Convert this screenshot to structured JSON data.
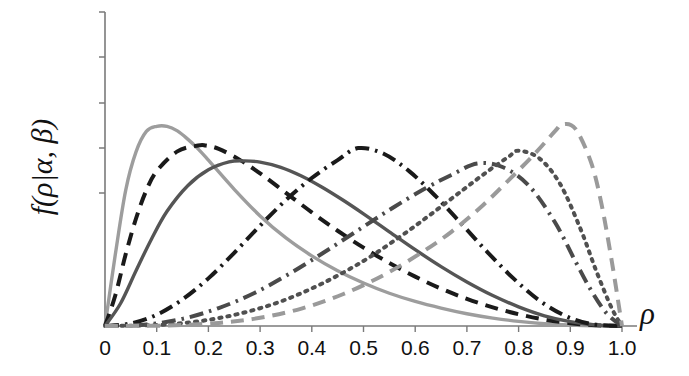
{
  "chart_data": {
    "type": "line",
    "title": "",
    "subtitle": "",
    "xlabel": "ρ",
    "ylabel": "f(ρ|α, β)",
    "xlim": [
      0,
      1.0
    ],
    "ylim": [
      0,
      1.0
    ],
    "grid": false,
    "legend": "none",
    "y_axis_ticks_labeled": false,
    "y_tick_count": 5,
    "x_tick_labels": [
      "0",
      "0.1",
      "0.2",
      "0.3",
      "0.4",
      "0.5",
      "0.6",
      "0.7",
      "0.8",
      "0.9",
      "1.0"
    ],
    "x_tick_values": [
      0,
      0.1,
      0.2,
      0.3,
      0.4,
      0.5,
      0.6,
      0.7,
      0.8,
      0.9,
      1.0
    ],
    "series": [
      {
        "name": "curve-1",
        "style": "solid",
        "color": "#9d9d9d",
        "alpha": 2.6,
        "beta": 12.7,
        "peak_x": 0.12,
        "peak_y": 0.78,
        "x": [
          0.0,
          0.02,
          0.04,
          0.06,
          0.08,
          0.1,
          0.12,
          0.14,
          0.16,
          0.18,
          0.2,
          0.25,
          0.3,
          0.35,
          0.4,
          0.45,
          0.5,
          0.55,
          0.6,
          0.65,
          0.7,
          0.75,
          0.8,
          0.85,
          0.9,
          0.95,
          1.0
        ],
        "y": [
          0.0,
          0.28,
          0.53,
          0.68,
          0.76,
          0.78,
          0.78,
          0.762,
          0.73,
          0.692,
          0.648,
          0.534,
          0.43,
          0.344,
          0.274,
          0.216,
          0.168,
          0.128,
          0.096,
          0.07,
          0.048,
          0.031,
          0.018,
          0.009,
          0.004,
          0.001,
          0.0
        ]
      },
      {
        "name": "curve-2",
        "style": "dashed",
        "color": "#1a1a1a",
        "alpha": 3.1,
        "beta": 10.5,
        "peak_x": 0.195,
        "peak_y": 0.705,
        "x": [
          0.0,
          0.02,
          0.04,
          0.06,
          0.08,
          0.1,
          0.14,
          0.18,
          0.195,
          0.22,
          0.26,
          0.3,
          0.35,
          0.4,
          0.45,
          0.5,
          0.55,
          0.6,
          0.65,
          0.7,
          0.75,
          0.8,
          0.85,
          0.9,
          0.95,
          1.0
        ],
        "y": [
          0.0,
          0.12,
          0.28,
          0.42,
          0.53,
          0.605,
          0.682,
          0.705,
          0.705,
          0.692,
          0.65,
          0.596,
          0.52,
          0.444,
          0.372,
          0.306,
          0.246,
          0.193,
          0.146,
          0.106,
          0.073,
          0.046,
          0.025,
          0.011,
          0.003,
          0.0
        ]
      },
      {
        "name": "curve-3",
        "style": "solid",
        "color": "#555555",
        "alpha": 3.6,
        "beta": 8.6,
        "peak_x": 0.27,
        "peak_y": 0.645,
        "x": [
          0.0,
          0.03,
          0.06,
          0.09,
          0.12,
          0.16,
          0.2,
          0.24,
          0.27,
          0.3,
          0.34,
          0.38,
          0.42,
          0.46,
          0.5,
          0.55,
          0.6,
          0.65,
          0.7,
          0.75,
          0.8,
          0.85,
          0.9,
          0.95,
          1.0
        ],
        "y": [
          0.0,
          0.088,
          0.216,
          0.34,
          0.448,
          0.548,
          0.61,
          0.641,
          0.645,
          0.64,
          0.62,
          0.586,
          0.542,
          0.492,
          0.438,
          0.368,
          0.298,
          0.232,
          0.172,
          0.119,
          0.075,
          0.04,
          0.017,
          0.004,
          0.0
        ]
      },
      {
        "name": "curve-4",
        "style": "dashdot",
        "color": "#1a1a1a",
        "alpha": 6.4,
        "beta": 6.4,
        "peak_x": 0.49,
        "peak_y": 0.695,
        "x": [
          0.0,
          0.05,
          0.1,
          0.15,
          0.2,
          0.25,
          0.3,
          0.35,
          0.4,
          0.45,
          0.49,
          0.54,
          0.59,
          0.64,
          0.69,
          0.74,
          0.79,
          0.84,
          0.89,
          0.94,
          1.0
        ],
        "y": [
          0.0,
          0.01,
          0.044,
          0.104,
          0.186,
          0.286,
          0.392,
          0.492,
          0.578,
          0.648,
          0.695,
          0.672,
          0.602,
          0.506,
          0.398,
          0.288,
          0.186,
          0.1,
          0.04,
          0.008,
          0.0
        ]
      },
      {
        "name": "curve-5",
        "style": "dashdot",
        "color": "#4a4a4a",
        "alpha": 8.0,
        "beta": 3.9,
        "peak_x": 0.72,
        "peak_y": 0.635,
        "x": [
          0.0,
          0.08,
          0.15,
          0.22,
          0.29,
          0.36,
          0.43,
          0.5,
          0.56,
          0.62,
          0.67,
          0.72,
          0.77,
          0.82,
          0.87,
          0.91,
          0.94,
          0.97,
          1.0
        ],
        "y": [
          0.0,
          0.006,
          0.028,
          0.07,
          0.13,
          0.208,
          0.296,
          0.388,
          0.466,
          0.538,
          0.59,
          0.635,
          0.62,
          0.548,
          0.406,
          0.252,
          0.14,
          0.05,
          0.0
        ]
      },
      {
        "name": "curve-6",
        "style": "dotted",
        "color": "#505050",
        "alpha": 11.0,
        "beta": 3.5,
        "peak_x": 0.8,
        "peak_y": 0.685,
        "x": [
          0.0,
          0.1,
          0.18,
          0.26,
          0.34,
          0.42,
          0.5,
          0.57,
          0.63,
          0.69,
          0.74,
          0.78,
          0.8,
          0.84,
          0.88,
          0.92,
          0.95,
          0.98,
          1.0
        ],
        "y": [
          0.0,
          0.004,
          0.018,
          0.048,
          0.096,
          0.166,
          0.254,
          0.348,
          0.436,
          0.528,
          0.604,
          0.66,
          0.685,
          0.655,
          0.556,
          0.378,
          0.216,
          0.07,
          0.0
        ]
      },
      {
        "name": "curve-7",
        "style": "dashed",
        "color": "#9a9a9a",
        "alpha": 14.5,
        "beta": 2.8,
        "peak_x": 0.885,
        "peak_y": 0.788,
        "x": [
          0.0,
          0.12,
          0.22,
          0.3,
          0.38,
          0.46,
          0.54,
          0.61,
          0.67,
          0.73,
          0.78,
          0.83,
          0.87,
          0.885,
          0.91,
          0.94,
          0.96,
          0.98,
          1.0
        ],
        "y": [
          0.0,
          0.002,
          0.012,
          0.032,
          0.068,
          0.124,
          0.2,
          0.284,
          0.368,
          0.47,
          0.568,
          0.67,
          0.76,
          0.788,
          0.77,
          0.64,
          0.48,
          0.256,
          0.0
        ]
      }
    ]
  },
  "axes": {
    "y_axis_title": "f(ρ|α, β)",
    "x_axis_title": "ρ",
    "x_labels": [
      "0",
      "0.1",
      "0.2",
      "0.3",
      "0.4",
      "0.5",
      "0.6",
      "0.7",
      "0.8",
      "0.9",
      "1.0"
    ]
  }
}
